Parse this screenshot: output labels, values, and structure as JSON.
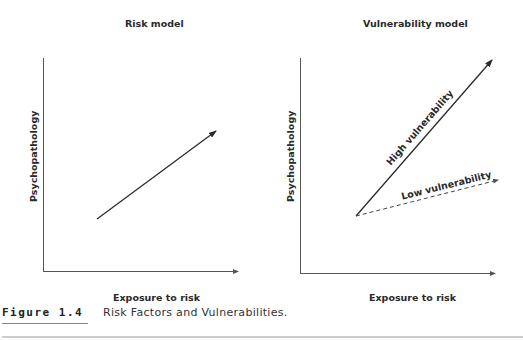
{
  "figure": {
    "number": "Figure 1.4",
    "caption": "Risk Factors and Vulnerabilities."
  },
  "panels": [
    {
      "title": "Risk model",
      "xlabel": "Exposure to risk",
      "ylabel": "Psychopathology",
      "lines": [
        {
          "label": "",
          "style": "solid",
          "from": [
            97,
            219
          ],
          "to": [
            216,
            131
          ]
        }
      ]
    },
    {
      "title": "Vulnerability model",
      "xlabel": "Exposure to risk",
      "ylabel": "Psychopathology",
      "lines": [
        {
          "label": "High vulnerability",
          "style": "solid",
          "from": [
            356,
            216
          ],
          "to": [
            492,
            60
          ]
        },
        {
          "label": "Low vulnerability",
          "style": "dashed",
          "from": [
            356,
            216
          ],
          "to": [
            498,
            180
          ]
        }
      ]
    }
  ],
  "colors": {
    "line": "#2b2b2b",
    "axis": "#555555",
    "rule": "#bbbbbb"
  }
}
